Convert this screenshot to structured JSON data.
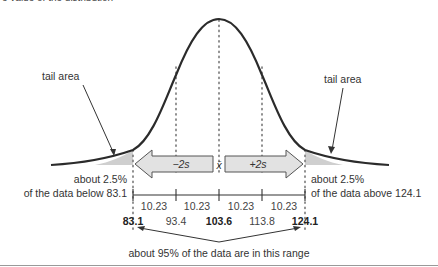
{
  "caption_fragment": "e value of the distribution",
  "labels": {
    "tail_left": "tail area",
    "tail_right": "tail area",
    "left_pct": "about 2.5%",
    "left_desc": "of the data below 83.1",
    "right_pct": "about 2.5%",
    "right_desc": "of the data above 124.1",
    "minus_2s": "−2s",
    "plus_2s": "+2s",
    "mean_symbol": "x̄",
    "range_note": "about 95% of the data are in this range"
  },
  "intervals": [
    "10.23",
    "10.23",
    "10.23",
    "10.23"
  ],
  "ticks": [
    {
      "value": "83.1",
      "bold": true
    },
    {
      "value": "93.4",
      "bold": false
    },
    {
      "value": "103.6",
      "bold": true
    },
    {
      "value": "113.8",
      "bold": false
    },
    {
      "value": "124.1",
      "bold": true
    }
  ],
  "colors": {
    "curve": "#2b2b2b",
    "tail_fill": "#cfcfcf",
    "arrow_fill": "#e2e2e2",
    "arrow_stroke": "#555555",
    "dots": "#777777"
  }
}
